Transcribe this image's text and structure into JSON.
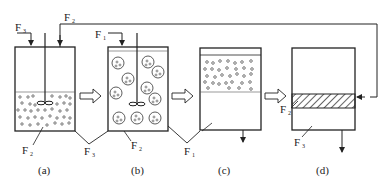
{
  "diagram": {
    "type": "process-flow",
    "stroke_color": "#222222",
    "background": "#ffffff",
    "panels": [
      {
        "id": "a",
        "caption": "(a)",
        "content": "stirred vessel with stirrer, lower portion filled with small particles",
        "labels": [
          "F3",
          "F2",
          "F3"
        ]
      },
      {
        "id": "b",
        "caption": "(b)",
        "content": "stirred vessel with large circles each containing small particles",
        "labels": [
          "F1",
          "F2",
          "F1"
        ]
      },
      {
        "id": "c",
        "caption": "(c)",
        "content": "settling vessel, upper layer with particles, outlet at bottom",
        "labels": [
          "F1"
        ]
      },
      {
        "id": "d",
        "caption": "(d)",
        "content": "vessel with hatched middle layer, outlet at bottom",
        "labels": [
          "F2",
          "F3"
        ]
      }
    ],
    "stream_labels": {
      "F1": {
        "base": "F",
        "sub": "1"
      },
      "F2": {
        "base": "F",
        "sub": "2"
      },
      "F3": {
        "base": "F",
        "sub": "3"
      }
    },
    "captions": [
      "(a)",
      "(b)",
      "(c)",
      "(d)"
    ],
    "arrows": [
      {
        "from": "a",
        "to": "b",
        "style": "hollow"
      },
      {
        "from": "b",
        "to": "c",
        "style": "hollow"
      },
      {
        "from": "c",
        "to": "d",
        "style": "hollow"
      },
      {
        "from": "d",
        "to": "a",
        "label": "F2",
        "style": "line-recycle"
      }
    ]
  }
}
